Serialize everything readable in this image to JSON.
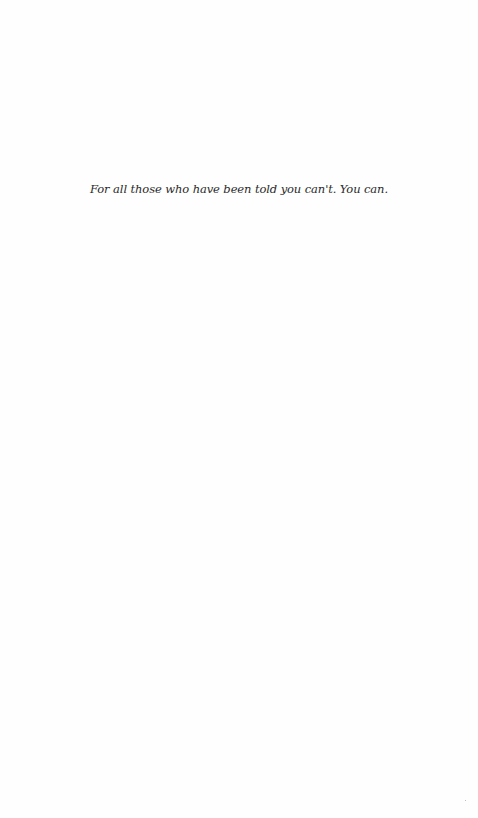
{
  "page": {
    "type": "dedication",
    "dedication_text": "For all those who have been told you can't. You can."
  },
  "colors": {
    "background": "#fefefe",
    "text": "#2a2a2a"
  }
}
